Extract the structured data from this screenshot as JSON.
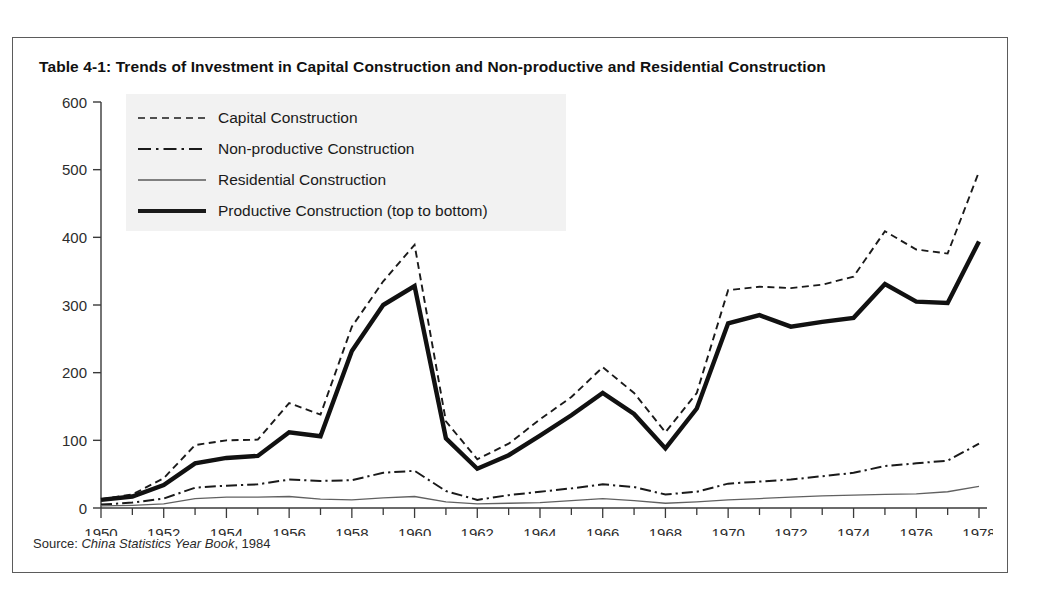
{
  "figure": {
    "table_number": "Table 4-1:",
    "title": "Trends of Investment in Capital Construction and Non-productive and Residential Construction",
    "source_prefix": "Source:",
    "source_title": "China Statistics Year Book",
    "source_year": ", 1984"
  },
  "legend": {
    "items": [
      {
        "label": "Capital Construction",
        "style": "dashed",
        "key_icon": "dashed-line-icon"
      },
      {
        "label": "Non-productive Construction",
        "style": "dash-dot",
        "key_icon": "dash-dot-line-icon"
      },
      {
        "label": "Residential Construction",
        "style": "thin-solid",
        "key_icon": "thin-line-icon"
      },
      {
        "label": "Productive Construction (top to bottom)",
        "style": "thick-solid",
        "key_icon": "thick-line-icon"
      }
    ]
  },
  "chart_data": {
    "type": "line",
    "title": "Trends of Investment in Capital Construction and Non-productive and Residential Construction",
    "xlabel": "",
    "ylabel": "",
    "xlim": [
      1950,
      1978
    ],
    "ylim": [
      0,
      600
    ],
    "yticks": [
      0,
      100,
      200,
      300,
      400,
      500,
      600
    ],
    "ytick_labels": [
      "0",
      "100",
      "200",
      "300",
      "400",
      "500",
      "600"
    ],
    "x": [
      1950,
      1951,
      1952,
      1953,
      1954,
      1955,
      1956,
      1957,
      1958,
      1959,
      1960,
      1961,
      1962,
      1963,
      1964,
      1965,
      1966,
      1967,
      1968,
      1969,
      1970,
      1971,
      1972,
      1973,
      1974,
      1975,
      1976,
      1977,
      1978
    ],
    "xticks_major": [
      1950,
      1952,
      1954,
      1956,
      1958,
      1960,
      1962,
      1964,
      1966,
      1968,
      1970,
      1972,
      1974,
      1976,
      1978
    ],
    "xtick_labels": [
      "1950",
      "1952",
      "1954",
      "1956",
      "1958",
      "1960",
      "1962",
      "1964",
      "1966",
      "1968",
      "1970",
      "1972",
      "1974",
      "1976",
      "1978"
    ],
    "grid": false,
    "legend_position": "upper-left",
    "series": [
      {
        "name": "Capital Construction",
        "style": "dashed",
        "values": [
          13,
          20,
          44,
          93,
          100,
          101,
          155,
          138,
          268,
          335,
          389,
          128,
          72,
          95,
          131,
          164,
          208,
          170,
          112,
          170,
          322,
          327,
          325,
          330,
          342,
          409,
          382,
          376,
          497
        ]
      },
      {
        "name": "Non-productive Construction",
        "style": "dash-dot",
        "values": [
          5,
          8,
          14,
          30,
          33,
          35,
          42,
          40,
          41,
          52,
          55,
          25,
          12,
          19,
          24,
          29,
          35,
          31,
          20,
          24,
          36,
          39,
          42,
          47,
          52,
          62,
          66,
          70,
          95
        ]
      },
      {
        "name": "Residential Construction",
        "style": "thin-solid",
        "values": [
          3,
          4,
          6,
          14,
          16,
          16,
          17,
          13,
          12,
          15,
          17,
          9,
          6,
          7,
          8,
          11,
          14,
          11,
          7,
          9,
          12,
          14,
          16,
          18,
          19,
          20,
          21,
          24,
          32
        ]
      },
      {
        "name": "Productive Construction (top to bottom)",
        "style": "thick-solid",
        "values": [
          12,
          17,
          34,
          66,
          74,
          77,
          112,
          106,
          232,
          300,
          328,
          103,
          58,
          78,
          107,
          137,
          170,
          139,
          88,
          147,
          273,
          285,
          268,
          275,
          281,
          331,
          305,
          303,
          394
        ]
      }
    ]
  }
}
